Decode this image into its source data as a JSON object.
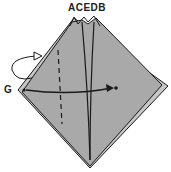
{
  "diagram": {
    "top_labels": "ACEDB",
    "left_label": "G",
    "colors": {
      "paper": "#a9a9a9",
      "paper_back": "#c6c6c6",
      "line": "#1a1a1a",
      "background": "#ffffff"
    }
  }
}
